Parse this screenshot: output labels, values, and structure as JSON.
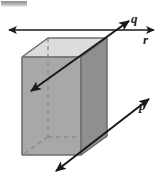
{
  "figure": {
    "type": "geometry-diagram",
    "background_color": "#ffffff",
    "labels": [
      {
        "id": "q",
        "text": "q",
        "description": "line through the prism diagonally, double-headed arrow"
      },
      {
        "id": "r",
        "text": "r",
        "description": "horizontal line across the top of the prism, double-headed arrow"
      },
      {
        "id": "p",
        "text": "p",
        "description": "line to the lower right of the prism, parallel to q, double-headed arrow"
      }
    ],
    "colors": {
      "top_face": "#dcdcdc",
      "left_face": "#a8a8a8",
      "front_right_face": "#8f8f8f",
      "back_face": "#c4c4c4",
      "edge_stroke": "#5a5a5a",
      "hidden_edge_stroke": "#8a8a8a",
      "line_stroke": "#1a1a1a",
      "label_color": "#1a1a1a"
    },
    "prism": {
      "visible_edges": "solid gray outline",
      "hidden_edges": "dashed gray lines showing back vertical edge and back base edges"
    },
    "lines": {
      "q": {
        "style": "double-headed arrow",
        "from": [
          30,
          92
        ],
        "to": [
          130,
          22
        ]
      },
      "r": {
        "style": "double-headed arrow",
        "from": [
          8,
          30
        ],
        "to": [
          155,
          30
        ]
      },
      "p": {
        "style": "double-headed arrow",
        "from": [
          55,
          172
        ],
        "to": [
          150,
          98
        ]
      }
    }
  }
}
